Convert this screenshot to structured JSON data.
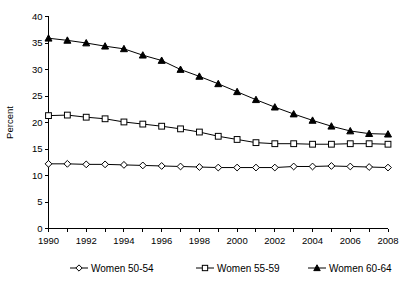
{
  "chart_data": {
    "type": "line",
    "title": "",
    "xlabel": "",
    "ylabel": "Percent",
    "xlim": [
      1990,
      2008
    ],
    "ylim": [
      0,
      40
    ],
    "yticks": [
      0,
      5,
      10,
      15,
      20,
      25,
      30,
      35,
      40
    ],
    "ytick_labels": [
      "0",
      "5",
      "10",
      "15",
      "20",
      "25",
      "30",
      "35",
      "40"
    ],
    "x": [
      1990,
      1991,
      1992,
      1993,
      1994,
      1995,
      1996,
      1997,
      1998,
      1999,
      2000,
      2001,
      2002,
      2003,
      2004,
      2005,
      2006,
      2007,
      2008
    ],
    "xtick_labels": [
      "1990",
      "1992",
      "1994",
      "1996",
      "1998",
      "2000",
      "2002",
      "2004",
      "2006",
      "2008"
    ],
    "xticks_labeled": [
      1990,
      1992,
      1994,
      1996,
      1998,
      2000,
      2002,
      2004,
      2006,
      2008
    ],
    "grid": false,
    "legend_position": "bottom",
    "series": [
      {
        "name": "Women 50-54",
        "marker": "diamond-open",
        "values": [
          12.2,
          12.2,
          12.1,
          12.1,
          12.0,
          11.9,
          11.8,
          11.7,
          11.6,
          11.5,
          11.5,
          11.5,
          11.5,
          11.7,
          11.7,
          11.8,
          11.7,
          11.6,
          11.5
        ]
      },
      {
        "name": "Women 55-59",
        "marker": "square-open",
        "values": [
          21.3,
          21.4,
          21.0,
          20.7,
          20.1,
          19.7,
          19.3,
          18.8,
          18.2,
          17.4,
          16.8,
          16.2,
          16.0,
          16.0,
          15.9,
          15.9,
          16.0,
          16.0,
          15.9
        ]
      },
      {
        "name": "Women 60-64",
        "marker": "triangle-filled",
        "values": [
          35.9,
          35.5,
          35.0,
          34.4,
          33.9,
          32.7,
          31.7,
          30.0,
          28.7,
          27.3,
          25.8,
          24.3,
          22.9,
          21.6,
          20.4,
          19.3,
          18.4,
          17.9,
          17.8
        ]
      }
    ]
  },
  "legend": {
    "items": [
      {
        "label": "Women 50-54",
        "marker": "diamond-open"
      },
      {
        "label": "Women 55-59",
        "marker": "square-open"
      },
      {
        "label": "Women 60-64",
        "marker": "triangle-filled"
      }
    ]
  },
  "axes": {
    "y_title": "Percent"
  }
}
